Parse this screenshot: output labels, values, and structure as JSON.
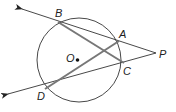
{
  "diagram": {
    "type": "circle-secants",
    "colors": {
      "circle": "#333333",
      "secant": "#333333",
      "chord": "#777777",
      "label": "#222222",
      "background": "#ffffff"
    },
    "circle": {
      "center_label": "O",
      "cx": 79,
      "cy": 60,
      "r": 42
    },
    "points": {
      "A": {
        "label": "A",
        "x": 119,
        "y": 41
      },
      "B": {
        "label": "B",
        "x": 58,
        "y": 22
      },
      "C": {
        "label": "C",
        "x": 124,
        "y": 63
      },
      "D": {
        "label": "D",
        "x": 45,
        "y": 89
      },
      "P": {
        "label": "P",
        "x": 156,
        "y": 53
      },
      "O": {
        "label": "O",
        "x": 77,
        "y": 60
      }
    },
    "secants": [
      {
        "name": "ray PB",
        "through": [
          "P",
          "A",
          "B"
        ]
      },
      {
        "name": "ray PD",
        "through": [
          "P",
          "C",
          "D"
        ]
      }
    ],
    "chords": [
      {
        "name": "BC",
        "from": "B",
        "to": "C"
      },
      {
        "name": "DA",
        "from": "D",
        "to": "A"
      }
    ]
  }
}
